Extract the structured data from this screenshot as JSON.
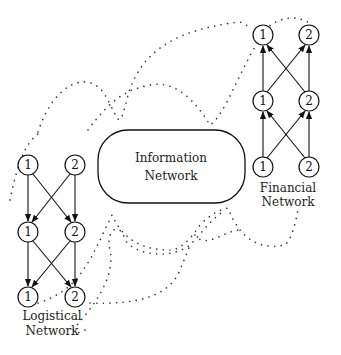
{
  "diagram": {
    "information_network": {
      "label_line1": "Information",
      "label_line2": "Network"
    },
    "logistical_network": {
      "label_line1": "Logistical",
      "label_line2": "Network",
      "arrow_direction": "down",
      "layers": [
        [
          "1",
          "2"
        ],
        [
          "1",
          "2"
        ],
        [
          "1",
          "2"
        ]
      ]
    },
    "financial_network": {
      "label_line1": "Financial",
      "label_line2": "Network",
      "arrow_direction": "up",
      "layers": [
        [
          "1",
          "2"
        ],
        [
          "1",
          "2"
        ],
        [
          "1",
          "2"
        ]
      ]
    },
    "connections": "dotted curves linking logistical network nodes to financial network nodes via information network"
  }
}
